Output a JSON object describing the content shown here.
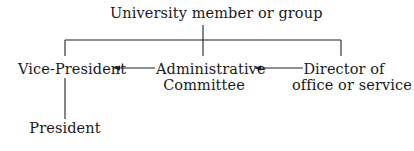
{
  "diagram": {
    "type": "organizational-flow",
    "nodes": {
      "top": "University member or group",
      "vice_president": "Vice-President",
      "admin_committee": {
        "line1": "Administrative",
        "line2": "Committee"
      },
      "director": {
        "line1": "Director of",
        "line2": "office or service"
      },
      "president": "President"
    },
    "edges": [
      {
        "from": "University member or group",
        "to": "Vice-President",
        "style": "line"
      },
      {
        "from": "University member or group",
        "to": "Administrative Committee",
        "style": "line"
      },
      {
        "from": "University member or group",
        "to": "Director of office or service",
        "style": "line"
      },
      {
        "from": "Director of office or service",
        "to": "Administrative Committee",
        "style": "arrow"
      },
      {
        "from": "Administrative Committee",
        "to": "Vice-President",
        "style": "arrow"
      },
      {
        "from": "Vice-President",
        "to": "President",
        "style": "line"
      }
    ],
    "colors": {
      "ink": "#222222",
      "background": "#ffffff"
    }
  }
}
